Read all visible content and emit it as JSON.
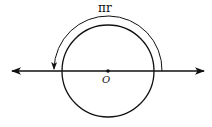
{
  "diagram": {
    "type": "geometry",
    "arc_label": "πr",
    "center_label": "O",
    "elements": [
      {
        "kind": "circle",
        "center": "O",
        "description": "circle with center O"
      },
      {
        "kind": "line",
        "description": "horizontal line through O with arrows on both ends"
      },
      {
        "kind": "arc-arrow",
        "description": "semicircular arc above the circle, arrow pointing to left intersection point, labeled πr"
      }
    ],
    "colors": {
      "stroke": "#111111",
      "background": "#ffffff"
    }
  }
}
